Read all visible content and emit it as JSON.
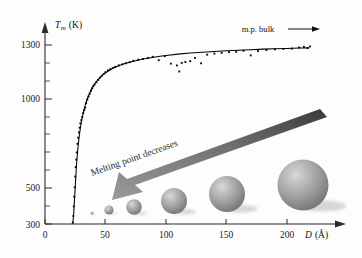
{
  "figure": {
    "name": "melting-point-vs-nanoparticle-diameter"
  },
  "axes": {
    "y": {
      "label_symbol": "T",
      "label_sub": "m",
      "label_unit": "(K)",
      "ticks": [
        "300",
        "500",
        "1000",
        "1300"
      ],
      "tick_values": [
        300,
        500,
        1000,
        1300
      ],
      "minor_tick_values": [
        400,
        600,
        700,
        800,
        900,
        1100,
        1200
      ],
      "range": [
        300,
        1360
      ],
      "arrow": "up-arrow-icon"
    },
    "x": {
      "label_symbol": "D",
      "label_unit": "(Å)",
      "ticks": [
        "0",
        "50",
        "100",
        "150",
        "200"
      ],
      "tick_values": [
        0,
        50,
        100,
        150,
        200
      ],
      "range": [
        0,
        230
      ],
      "arrow": "right-arrow-icon"
    }
  },
  "annotations": {
    "bulk": {
      "text": "m.p. bulk",
      "arrow": "right-arrow-icon"
    },
    "trend": {
      "text": "Melting point decreases",
      "arrow": "down-left-arrow-icon",
      "color": "#6e6e6e"
    }
  },
  "spheres": [
    {
      "cx": 92,
      "cy": 213,
      "r": 1.6
    },
    {
      "cx": 109,
      "cy": 210,
      "r": 4.6
    },
    {
      "cx": 134,
      "cy": 207,
      "r": 7.8
    },
    {
      "cx": 174,
      "cy": 201,
      "r": 13.0
    },
    {
      "cx": 227,
      "cy": 194,
      "r": 18.0
    },
    {
      "cx": 303,
      "cy": 185,
      "r": 25.5
    }
  ],
  "chart_data": {
    "type": "scatter",
    "title": "",
    "xlabel": "D (Å)",
    "ylabel": "Tm (K)",
    "xlim": [
      0,
      230
    ],
    "ylim": [
      300,
      1360
    ],
    "grid": false,
    "legend": "none",
    "series": [
      {
        "name": "fitted curve",
        "type": "line",
        "x": [
          23,
          23.5,
          24,
          24.5,
          25,
          25.5,
          26,
          27,
          28,
          29,
          30,
          31,
          32,
          33,
          34,
          35,
          36,
          38,
          40,
          42,
          44,
          46,
          48,
          50,
          54,
          58,
          62,
          66,
          70,
          75,
          80,
          85,
          90,
          95,
          100,
          110,
          120,
          130,
          140,
          150,
          160,
          170,
          180,
          190,
          200,
          210,
          218
        ],
        "y": [
          305,
          340,
          390,
          450,
          510,
          570,
          625,
          710,
          775,
          825,
          868,
          902,
          932,
          957,
          980,
          1000,
          1018,
          1048,
          1072,
          1092,
          1108,
          1122,
          1134,
          1145,
          1162,
          1176,
          1187,
          1196,
          1204,
          1212,
          1220,
          1226,
          1232,
          1237,
          1241,
          1249,
          1255,
          1260,
          1264,
          1268,
          1271,
          1274,
          1277,
          1279,
          1281,
          1283,
          1284
        ]
      },
      {
        "name": "measured data",
        "type": "scatter",
        "x": [
          23,
          23.4,
          23.8,
          24.2,
          24.6,
          25,
          25.4,
          25.8,
          26.2,
          26.8,
          27.4,
          28,
          28.6,
          29.2,
          30,
          30.8,
          31.6,
          32.4,
          33.2,
          34,
          35,
          36,
          37,
          38,
          39,
          40,
          41,
          42.5,
          44,
          45.5,
          47,
          48.5,
          50,
          52,
          54,
          56,
          58,
          61,
          64,
          67,
          70,
          73,
          77,
          81,
          85,
          89,
          94,
          99,
          104,
          109,
          111,
          113,
          116,
          120,
          124,
          129,
          134,
          140,
          146,
          152,
          158,
          164,
          170,
          176,
          183,
          190,
          197,
          204,
          210,
          214,
          217,
          219
        ],
        "y": [
          308,
          345,
          398,
          452,
          505,
          565,
          618,
          660,
          700,
          748,
          782,
          812,
          838,
          862,
          880,
          898,
          920,
          936,
          950,
          975,
          995,
          1012,
          1028,
          1044,
          1058,
          1070,
          1080,
          1092,
          1105,
          1118,
          1128,
          1138,
          1148,
          1158,
          1165,
          1172,
          1178,
          1186,
          1192,
          1198,
          1204,
          1212,
          1218,
          1222,
          1228,
          1234,
          1215,
          1238,
          1196,
          1186,
          1152,
          1200,
          1205,
          1210,
          1228,
          1198,
          1246,
          1252,
          1256,
          1260,
          1262,
          1268,
          1242,
          1266,
          1272,
          1276,
          1278,
          1280,
          1286,
          1290,
          1283,
          1292
        ]
      }
    ]
  }
}
